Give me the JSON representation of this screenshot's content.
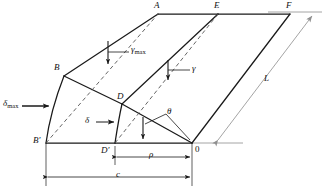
{
  "figure": {
    "type": "engineering-diagram",
    "colors": {
      "line": "#1a1a1a",
      "dashed": "#555555",
      "dimension": "#9a9a9a",
      "background": "#ffffff"
    }
  },
  "vertices": {
    "a": "A",
    "e": "E",
    "f": "F",
    "b": "B",
    "b_prime": "B'",
    "d": "D",
    "d_prime": "D'",
    "origin": "0"
  },
  "annotations": {
    "gamma_max_symbol": "γ",
    "gamma_max_sub": "max",
    "gamma_symbol": "γ",
    "delta_max_symbol": "δ",
    "delta_max_sub": "max",
    "delta_symbol": "δ",
    "theta_symbol": "θ"
  },
  "dimensions": {
    "rho": "ρ",
    "c": "c",
    "length": "L"
  }
}
